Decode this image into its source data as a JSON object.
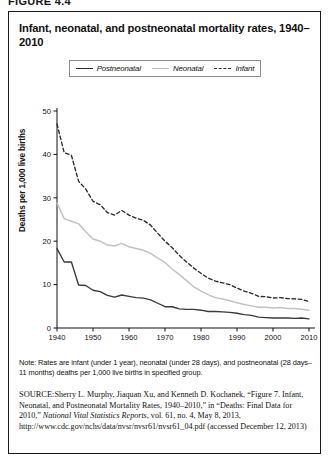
{
  "figure": {
    "number_label": "FIGURE 4.4",
    "title": "Infant, neonatal, and postneonatal mortality rates, 1940–2010"
  },
  "legend": {
    "items": [
      {
        "label": "Postneonatal",
        "swatch": "solid-dark-line-icon",
        "color": "#2b2b2b"
      },
      {
        "label": "Neonatal",
        "swatch": "solid-light-line-icon",
        "color": "#c2c2c2"
      },
      {
        "label": "Infant",
        "swatch": "dashed-dark-line-icon",
        "color": "#2b2b2b"
      }
    ]
  },
  "notes": {
    "note_text": "Note: Rates are infant (under 1 year), neonatal (under 28 days), and postneonatal (28 days–11 months) deaths per 1,000 live births in specified group.",
    "source_kicker": "SOURCE:",
    "source_text": "Sherry L. Murphy, Jiaquan Xu, and Kenneth D. Kochanek, “Figure 7. Infant, Neonatal, and Postneonatal Mortality Rates, 1940–2010,” in “Deaths: Final Data for 2010,” ",
    "source_italic": "National Vital Statistics Reports",
    "source_tail": ", vol. 61, no. 4, May 8, 2013, http://www.cdc.gov/nchs/data/nvsr/nvsr61/nvsr61_04.pdf (accessed December 12, 2013)"
  },
  "chart_data": {
    "type": "line",
    "title": "Infant, neonatal, and postneonatal mortality rates, 1940–2010",
    "xlabel": "",
    "ylabel": "Deaths per 1,000 live births",
    "xlim": [
      1940,
      2010
    ],
    "ylim": [
      0,
      50
    ],
    "xticks": [
      1940,
      1950,
      1960,
      1970,
      1980,
      1990,
      2000,
      2010
    ],
    "yticks": [
      0,
      10,
      20,
      30,
      40,
      50
    ],
    "grid": false,
    "legend_position": "top-center",
    "x": [
      1940,
      1942,
      1944,
      1946,
      1948,
      1950,
      1952,
      1954,
      1956,
      1958,
      1960,
      1962,
      1964,
      1966,
      1968,
      1970,
      1972,
      1974,
      1976,
      1978,
      1980,
      1982,
      1984,
      1986,
      1988,
      1990,
      1992,
      1994,
      1996,
      1998,
      2000,
      2002,
      2004,
      2006,
      2008,
      2010
    ],
    "series": [
      {
        "name": "Infant",
        "style": "dashed",
        "color": "#2b2b2b",
        "values": [
          47.0,
          40.4,
          39.8,
          33.8,
          32.0,
          29.2,
          28.4,
          26.6,
          26.0,
          27.1,
          26.0,
          25.3,
          24.8,
          23.7,
          21.8,
          20.0,
          18.5,
          16.7,
          15.2,
          13.8,
          12.6,
          11.5,
          10.8,
          10.4,
          10.0,
          9.2,
          8.5,
          8.0,
          7.3,
          7.2,
          6.9,
          7.0,
          6.8,
          6.7,
          6.6,
          6.1
        ]
      },
      {
        "name": "Neonatal",
        "style": "solid",
        "color": "#c2c2c2",
        "values": [
          28.8,
          25.2,
          24.6,
          24.0,
          22.2,
          20.5,
          20.0,
          19.1,
          18.9,
          19.5,
          18.7,
          18.3,
          17.9,
          17.2,
          16.1,
          15.1,
          13.6,
          12.3,
          10.9,
          9.5,
          8.5,
          7.7,
          7.0,
          6.7,
          6.3,
          5.8,
          5.4,
          5.1,
          4.8,
          4.8,
          4.6,
          4.7,
          4.5,
          4.5,
          4.3,
          4.1
        ]
      },
      {
        "name": "Postneonatal",
        "style": "solid",
        "color": "#3a3a3a",
        "values": [
          18.3,
          15.2,
          15.2,
          9.9,
          9.8,
          8.7,
          8.4,
          7.5,
          7.1,
          7.6,
          7.3,
          7.0,
          6.9,
          6.5,
          5.7,
          4.9,
          4.9,
          4.4,
          4.3,
          4.3,
          4.1,
          3.8,
          3.8,
          3.7,
          3.6,
          3.4,
          3.1,
          2.9,
          2.5,
          2.4,
          2.3,
          2.3,
          2.3,
          2.2,
          2.3,
          2.1
        ]
      }
    ]
  }
}
